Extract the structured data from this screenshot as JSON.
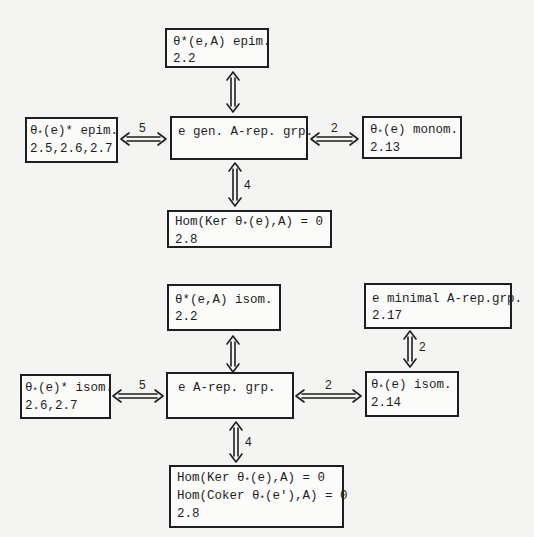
{
  "diagram": {
    "upper": {
      "top": {
        "line1": "θ*(e,A) epim.",
        "line2": "2.2"
      },
      "left": {
        "line1_pre": "θ",
        "line1_sub": "*",
        "line1_post": "(e)* epim.",
        "line2": "2.5,2.6,2.7"
      },
      "center": {
        "line1": "e gen. A-rep. grp."
      },
      "right": {
        "line1_pre": "θ",
        "line1_sub": "*",
        "line1_post": "(e) monom.",
        "line2": "2.13"
      },
      "bottom": {
        "line1_pre": "Hom(Ker θ",
        "line1_sub": "*",
        "line1_post": "(e),A) = 0",
        "line2": "2.8"
      },
      "arrow_labels": {
        "left": "5",
        "right": "2",
        "bottom": "4"
      }
    },
    "lower": {
      "top": {
        "line1": "θ*(e,A) isom.",
        "line2": "2.2"
      },
      "top_right": {
        "line1": "e minimal A-rep.grp.",
        "line2": "2.17"
      },
      "left": {
        "line1_pre": "θ",
        "line1_sub": "*",
        "line1_post": "(e)* isom.",
        "line2": "2.6,2.7"
      },
      "center": {
        "line1": "e A-rep. grp."
      },
      "right": {
        "line1_pre": "θ",
        "line1_sub": "*",
        "line1_post": "(e) isom.",
        "line2": "2.14"
      },
      "bottom": {
        "line1_pre": "Hom(Ker θ",
        "line1_sub": "*",
        "line1_post": "(e),A) = 0",
        "line2_pre": "Hom(Coker θ",
        "line2_sub": "*",
        "line2_post": "(e'),A) = 0",
        "line3": "2.8"
      },
      "arrow_labels": {
        "left": "5",
        "right": "2",
        "bottom": "4",
        "top_right": "2"
      }
    }
  }
}
